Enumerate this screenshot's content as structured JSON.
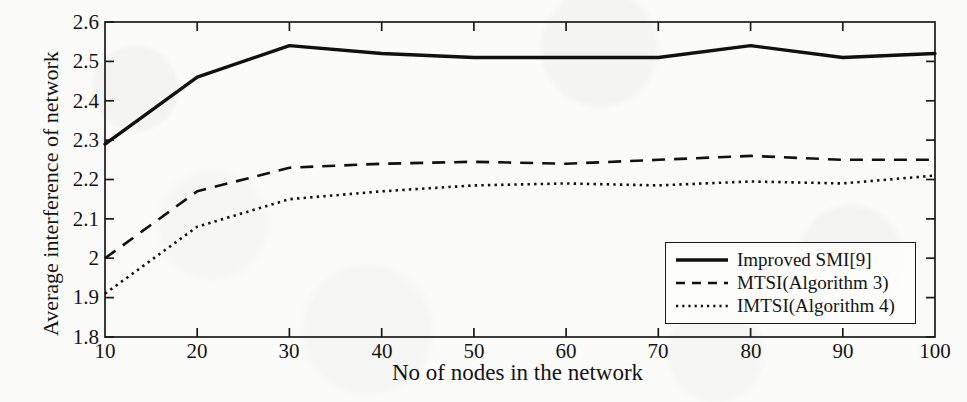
{
  "chart_data": {
    "type": "line",
    "title": "",
    "xlabel": "No of nodes in the network",
    "ylabel": "Average interference of network",
    "xlim": [
      10,
      100
    ],
    "ylim": [
      1.8,
      2.6
    ],
    "xticks": [
      10,
      20,
      30,
      40,
      50,
      60,
      70,
      80,
      90,
      100
    ],
    "yticks": [
      1.8,
      1.9,
      2.0,
      2.1,
      2.2,
      2.3,
      2.4,
      2.5,
      2.6
    ],
    "ytick_labels": [
      "1.8",
      "1.9",
      "2",
      "2.1",
      "2.2",
      "2.3",
      "2.4",
      "2.5",
      "2.6"
    ],
    "xtick_labels": [
      "10",
      "20",
      "30",
      "40",
      "50",
      "60",
      "70",
      "80",
      "90",
      "100"
    ],
    "grid": false,
    "legend_position": "lower right",
    "x": [
      10,
      20,
      30,
      40,
      50,
      60,
      70,
      80,
      90,
      100
    ],
    "series": [
      {
        "name": "Improved SMI[9]",
        "style": "solid",
        "color": "#111111",
        "values": [
          2.29,
          2.46,
          2.54,
          2.52,
          2.51,
          2.51,
          2.51,
          2.54,
          2.51,
          2.52
        ]
      },
      {
        "name": "MTSI(Algorithm 3)",
        "style": "dashed",
        "color": "#111111",
        "values": [
          2.0,
          2.17,
          2.23,
          2.24,
          2.245,
          2.24,
          2.25,
          2.26,
          2.25,
          2.25
        ]
      },
      {
        "name": "IMTSI(Algorithm 4)",
        "style": "dotted",
        "color": "#111111",
        "values": [
          1.91,
          2.08,
          2.15,
          2.17,
          2.185,
          2.19,
          2.185,
          2.195,
          2.19,
          2.21
        ]
      }
    ]
  },
  "axes": {
    "y_title": "Average interference of network",
    "x_title": "No of nodes in the network",
    "y_tick_0": "1.8",
    "y_tick_1": "1.9",
    "y_tick_2": "2",
    "y_tick_3": "2.1",
    "y_tick_4": "2.2",
    "y_tick_5": "2.3",
    "y_tick_6": "2.4",
    "y_tick_7": "2.5",
    "y_tick_8": "2.6",
    "x_tick_0": "10",
    "x_tick_1": "20",
    "x_tick_2": "30",
    "x_tick_3": "40",
    "x_tick_4": "50",
    "x_tick_5": "60",
    "x_tick_6": "70",
    "x_tick_7": "80",
    "x_tick_8": "90",
    "x_tick_9": "100"
  },
  "legend": {
    "entries": [
      {
        "label": "Improved SMI[9]",
        "style": "solid"
      },
      {
        "label": "MTSI(Algorithm 3)",
        "style": "dashed"
      },
      {
        "label": "IMTSI(Algorithm 4)",
        "style": "dotted"
      }
    ]
  }
}
